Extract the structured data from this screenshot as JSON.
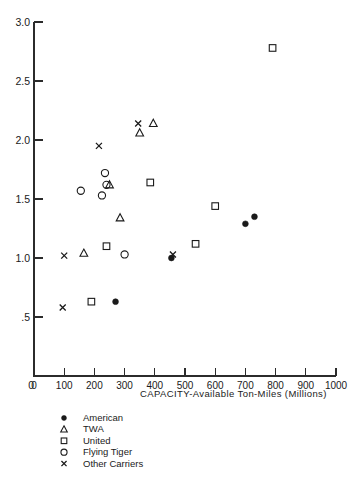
{
  "chart_data": {
    "type": "scatter",
    "title": "",
    "xlabel": "CAPACITY-Available Ton-Miles (Millions)",
    "ylabel": "",
    "xlim": [
      0,
      1000
    ],
    "ylim": [
      0,
      3.0
    ],
    "grid": false,
    "xticks": [
      0,
      100,
      200,
      300,
      400,
      500,
      600,
      700,
      800,
      900,
      1000
    ],
    "xticklabels": [
      "0",
      "100",
      "200",
      "300",
      "400",
      "500",
      "600",
      "700",
      "800",
      "900",
      "1000"
    ],
    "yticks": [
      0,
      0.5,
      1.0,
      1.5,
      2.0,
      2.5,
      3.0
    ],
    "yticklabels": [
      "0",
      ".5",
      "1.0",
      "1.5",
      "2.0",
      "2.5",
      "3.0"
    ],
    "legend_position": "below-left",
    "series": [
      {
        "name": "American",
        "marker": "filled-circle",
        "points": [
          {
            "x": 270,
            "y": 0.63
          },
          {
            "x": 455,
            "y": 1.0
          },
          {
            "x": 700,
            "y": 1.29
          },
          {
            "x": 730,
            "y": 1.35
          }
        ]
      },
      {
        "name": "TWA",
        "marker": "triangle",
        "points": [
          {
            "x": 165,
            "y": 1.04
          },
          {
            "x": 285,
            "y": 1.34
          },
          {
            "x": 250,
            "y": 1.62
          },
          {
            "x": 350,
            "y": 2.06
          },
          {
            "x": 395,
            "y": 2.14
          }
        ]
      },
      {
        "name": "United",
        "marker": "open-square",
        "points": [
          {
            "x": 190,
            "y": 0.63
          },
          {
            "x": 240,
            "y": 1.1
          },
          {
            "x": 535,
            "y": 1.12
          },
          {
            "x": 600,
            "y": 1.44
          },
          {
            "x": 385,
            "y": 1.64
          },
          {
            "x": 790,
            "y": 2.78
          }
        ]
      },
      {
        "name": "Flying Tiger",
        "marker": "open-circle",
        "points": [
          {
            "x": 300,
            "y": 1.03
          },
          {
            "x": 155,
            "y": 1.57
          },
          {
            "x": 225,
            "y": 1.53
          },
          {
            "x": 240,
            "y": 1.62
          },
          {
            "x": 235,
            "y": 1.72
          }
        ]
      },
      {
        "name": "Other Carriers",
        "marker": "x",
        "points": [
          {
            "x": 95,
            "y": 0.58
          },
          {
            "x": 100,
            "y": 1.02
          },
          {
            "x": 460,
            "y": 1.03
          },
          {
            "x": 215,
            "y": 1.95
          },
          {
            "x": 345,
            "y": 2.14
          }
        ]
      }
    ]
  },
  "legend": {
    "items": [
      {
        "marker": "filled-circle",
        "label": "American"
      },
      {
        "marker": "triangle",
        "label": "TWA"
      },
      {
        "marker": "open-square",
        "label": "United"
      },
      {
        "marker": "open-circle",
        "label": "Flying Tiger"
      },
      {
        "marker": "x",
        "label": "Other Carriers"
      }
    ]
  },
  "colors": {
    "ink": "#1a1a1a",
    "axis": "#2b2b2b",
    "background": "#ffffff"
  }
}
